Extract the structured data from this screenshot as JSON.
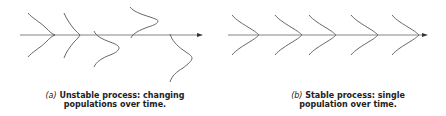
{
  "panels": [
    {
      "id": "a",
      "label": "(a)",
      "caption_line1": "Unstable process: changing",
      "caption_line2": "populations over time.",
      "distributions": [
        {
          "peak_x": 55,
          "center_y": 35,
          "spread": 15
        },
        {
          "peak_x": 80,
          "center_y": 35,
          "spread": 16
        },
        {
          "peak_x": 119,
          "center_y": 48,
          "spread": 16
        },
        {
          "peak_x": 158,
          "center_y": 21,
          "spread": 15
        },
        {
          "peak_x": 192,
          "center_y": 57,
          "spread": 22
        }
      ]
    },
    {
      "id": "b",
      "label": "(b)",
      "caption_line1": "Stable process: single",
      "caption_line2": "population over time.",
      "distributions": [
        {
          "peak_x": 36,
          "center_y": 35,
          "spread": 15
        },
        {
          "peak_x": 79,
          "center_y": 35,
          "spread": 15
        },
        {
          "peak_x": 113,
          "center_y": 35,
          "spread": 15
        },
        {
          "peak_x": 155,
          "center_y": 35,
          "spread": 15
        },
        {
          "peak_x": 196,
          "center_y": 35,
          "spread": 15
        }
      ]
    }
  ],
  "colors": {
    "line": "#555555",
    "arrow": "#333333",
    "text": "#222222"
  }
}
